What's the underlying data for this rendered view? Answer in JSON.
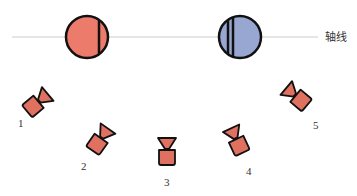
{
  "diagram": {
    "axis_label": "轴线",
    "colors": {
      "red": "#ec7b6c",
      "blue": "#98a6d2",
      "camera": "#e07060",
      "outline": "#111111",
      "axis_line": "#cccccc"
    },
    "circles": [
      {
        "name": "red-circle",
        "color": "red"
      },
      {
        "name": "blue-circle",
        "color": "blue"
      }
    ],
    "cameras": [
      {
        "label": "1"
      },
      {
        "label": "2"
      },
      {
        "label": "3"
      },
      {
        "label": "4"
      },
      {
        "label": "5"
      }
    ]
  }
}
